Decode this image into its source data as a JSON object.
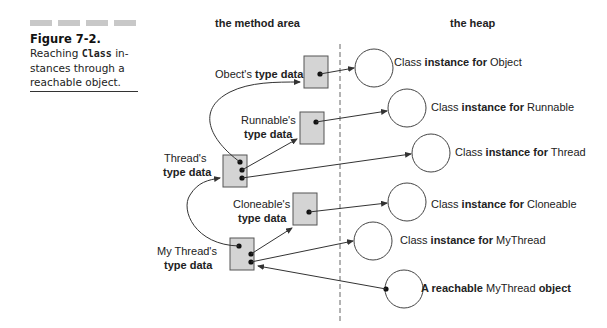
{
  "figure": {
    "title": "Figure 7-2.",
    "caption_pre": "Reaching ",
    "caption_code": "Class",
    "caption_post": " in-stances through a reachable object."
  },
  "headers": {
    "method_area": "the method area",
    "heap": "the heap"
  },
  "type_data": [
    {
      "owner": "Obect's",
      "suffix": "type data"
    },
    {
      "owner": "Runnable's",
      "suffix": "type data"
    },
    {
      "owner": "Thread's",
      "suffix": "type data"
    },
    {
      "owner": "Cloneable's",
      "suffix": "type data"
    },
    {
      "owner": "My Thread's",
      "suffix": "type data"
    }
  ],
  "class_instances": [
    {
      "prefix": "Class",
      "mid": "instance for",
      "name": "Object"
    },
    {
      "prefix": "Class",
      "mid": "instance for",
      "name": "Runnable"
    },
    {
      "prefix": "Class",
      "mid": "instance for",
      "name": "Thread"
    },
    {
      "prefix": "Class",
      "mid": "instance for",
      "name": "Cloneable"
    },
    {
      "prefix": "Class",
      "mid": "instance for",
      "name": "MyThread"
    }
  ],
  "reachable_object": {
    "pre": "A reachable",
    "name": "MyThread",
    "post": "object"
  },
  "colors": {
    "box_fill": "#d4d4d4",
    "line": "#333333"
  }
}
